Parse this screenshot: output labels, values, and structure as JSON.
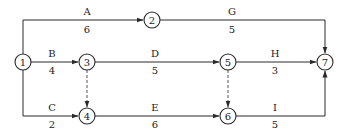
{
  "diagram": {
    "type": "activity-on-arrow network",
    "nodes": [
      {
        "id": "1",
        "label": "1"
      },
      {
        "id": "2",
        "label": "2"
      },
      {
        "id": "3",
        "label": "3"
      },
      {
        "id": "4",
        "label": "4"
      },
      {
        "id": "5",
        "label": "5"
      },
      {
        "id": "6",
        "label": "6"
      },
      {
        "id": "7",
        "label": "7"
      }
    ],
    "activities": [
      {
        "name": "A",
        "duration": "6",
        "from": "1",
        "to": "2"
      },
      {
        "name": "B",
        "duration": "4",
        "from": "1",
        "to": "3"
      },
      {
        "name": "C",
        "duration": "2",
        "from": "1",
        "to": "4"
      },
      {
        "name": "D",
        "duration": "5",
        "from": "3",
        "to": "5"
      },
      {
        "name": "E",
        "duration": "6",
        "from": "4",
        "to": "6"
      },
      {
        "name": "G",
        "duration": "5",
        "from": "2",
        "to": "7"
      },
      {
        "name": "H",
        "duration": "3",
        "from": "5",
        "to": "7"
      },
      {
        "name": "I",
        "duration": "5",
        "from": "6",
        "to": "7"
      }
    ],
    "dummies": [
      {
        "from": "3",
        "to": "4"
      },
      {
        "from": "5",
        "to": "6"
      }
    ]
  }
}
